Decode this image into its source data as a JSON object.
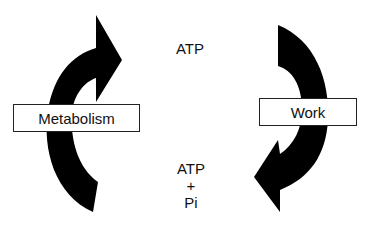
{
  "diagram": {
    "left_cycle": {
      "label": "Metabolism",
      "arrow_direction": "up"
    },
    "right_cycle": {
      "label": "Work",
      "arrow_direction": "down"
    },
    "top_molecule": "ATP",
    "bottom_molecules": {
      "line1": "ATP",
      "line2": "+",
      "line3": "Pi"
    },
    "colors": {
      "arrow": "#000000",
      "box_border": "#222222",
      "background": "#ffffff"
    }
  }
}
